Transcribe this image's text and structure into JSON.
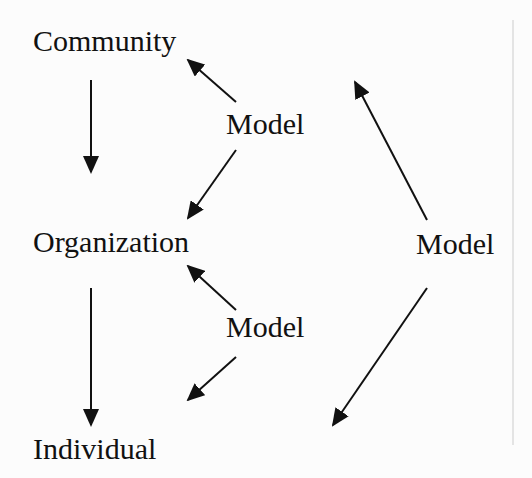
{
  "diagram": {
    "nodes": [
      {
        "id": "community",
        "label": "Community"
      },
      {
        "id": "organization",
        "label": "Organization"
      },
      {
        "id": "individual",
        "label": "Individual"
      },
      {
        "id": "model_1",
        "label": "Model"
      },
      {
        "id": "model_2",
        "label": "Model"
      },
      {
        "id": "model_3",
        "label": "Model"
      }
    ],
    "edges": [
      {
        "from": "community",
        "to": "organization"
      },
      {
        "from": "organization",
        "to": "individual"
      },
      {
        "from": "model_1",
        "to": "community"
      },
      {
        "from": "model_1",
        "to": "organization"
      },
      {
        "from": "model_2",
        "to": "organization"
      },
      {
        "from": "model_2",
        "to": "individual"
      },
      {
        "from": "model_3",
        "to": "community"
      },
      {
        "from": "model_3",
        "to": "individual"
      }
    ],
    "colors": {
      "stroke": "#111111",
      "background": "#fcfcfc",
      "divider": "#cccccc"
    }
  }
}
